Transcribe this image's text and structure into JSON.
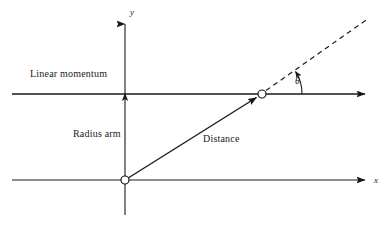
{
  "figure": {
    "type": "vector-diagram",
    "background_color": "#ffffff",
    "stroke_color": "#1a1a1a",
    "labels": {
      "linear_momentum": "Linear momentum",
      "radius_arm": "Radius arm",
      "distance": "Distance",
      "axis_y": "y",
      "axis_x": "x",
      "angle_theta": "θ"
    },
    "geometry": {
      "origin": {
        "x": 125,
        "y": 180
      },
      "intersection_point": {
        "x": 262,
        "y": 94
      },
      "x_axis": {
        "x1": 12,
        "y1": 180,
        "x2": 371,
        "y2": 180,
        "arrow": "right"
      },
      "y_axis": {
        "x1": 125,
        "y1": 215,
        "x2": 125,
        "y2": 16,
        "arrow": "up"
      },
      "momentum_line": {
        "x1": 12,
        "y1": 94,
        "x2": 371,
        "y2": 94,
        "arrow": "right"
      },
      "distance_vector": {
        "x1": 125,
        "y1": 180,
        "x2": 262,
        "y2": 94,
        "arrow": "end",
        "style": "solid"
      },
      "dashed_extension": {
        "x1": 262,
        "y1": 94,
        "x2": 369,
        "y2": 18,
        "style": "dashed"
      },
      "angle_arc": {
        "center_x": 262,
        "center_y": 94,
        "radius": 40,
        "from_deg": 0,
        "to_deg": 32,
        "arrow": "end"
      },
      "y_axis_tick": {
        "x": 125,
        "y": 94
      },
      "markers": [
        {
          "name": "origin-marker",
          "x": 125,
          "y": 180,
          "r": 4
        },
        {
          "name": "intersection-marker",
          "x": 262,
          "y": 94,
          "r": 4
        }
      ]
    }
  }
}
